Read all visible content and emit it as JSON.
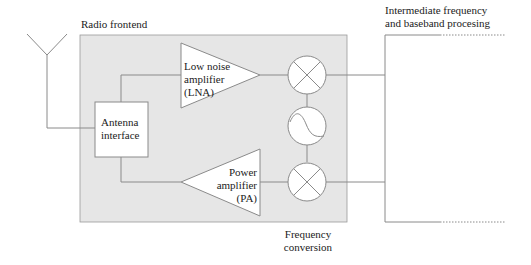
{
  "colors": {
    "frontend_fill": "#e6e6e6",
    "line": "#8a8a8a",
    "block_fill": "#ffffff"
  },
  "labels": {
    "radio_frontend": "Radio frontend",
    "if_baseband_line1": "Intermediate frequency",
    "if_baseband_line2": "and baseband procesing",
    "frequency_conversion_line1": "Frequency",
    "frequency_conversion_line2": "conversion"
  },
  "blocks": {
    "antenna_interface": {
      "line1": "Antenna",
      "line2": "interface"
    },
    "lna": {
      "line1": "Low noise",
      "line2": "amplifier",
      "line3": "(LNA)"
    },
    "pa": {
      "line1": "Power",
      "line2": "amplifier",
      "line3": "(PA)"
    },
    "mixer_rx": {
      "icon": "mixer-icon"
    },
    "oscillator": {
      "icon": "oscillator-icon"
    },
    "mixer_tx": {
      "icon": "mixer-icon"
    },
    "antenna": {
      "icon": "antenna-icon"
    }
  }
}
